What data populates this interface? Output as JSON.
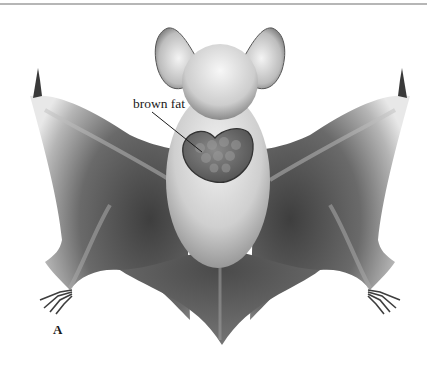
{
  "figure": {
    "panel_label": "A",
    "annotations": [
      {
        "text": "brown fat",
        "target": "interscapular brown fat deposit"
      }
    ]
  },
  "colors": {
    "rule": "#6f6f6f",
    "wing_dark": "#4a4a4a",
    "wing_light": "#d8d8d8",
    "fur": "#c9c9c9",
    "brown_fat_fill": "#6b6b6b",
    "brown_fat_edge": "#333333"
  }
}
